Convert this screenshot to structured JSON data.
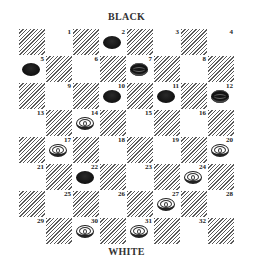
{
  "labels": {
    "top": "BLACK",
    "bottom": "WHITE"
  },
  "board": {
    "size": 8,
    "square_px": 27,
    "origin": [
      18,
      28
    ],
    "dark_square_style": "diagonal-hatch",
    "playable_squares": "light",
    "colors": {
      "hatch": "#5a5a5a",
      "light": "#ffffff",
      "black_piece": "#111111",
      "white_piece": "#ffffff"
    }
  },
  "squares": [
    {
      "n": 1,
      "row": 0,
      "col": 1
    },
    {
      "n": 2,
      "row": 0,
      "col": 3
    },
    {
      "n": 3,
      "row": 0,
      "col": 5
    },
    {
      "n": 4,
      "row": 0,
      "col": 7
    },
    {
      "n": 5,
      "row": 1,
      "col": 0
    },
    {
      "n": 6,
      "row": 1,
      "col": 2
    },
    {
      "n": 7,
      "row": 1,
      "col": 4
    },
    {
      "n": 8,
      "row": 1,
      "col": 6
    },
    {
      "n": 9,
      "row": 2,
      "col": 1
    },
    {
      "n": 10,
      "row": 2,
      "col": 3
    },
    {
      "n": 11,
      "row": 2,
      "col": 5
    },
    {
      "n": 12,
      "row": 2,
      "col": 7
    },
    {
      "n": 13,
      "row": 3,
      "col": 0
    },
    {
      "n": 14,
      "row": 3,
      "col": 2
    },
    {
      "n": 15,
      "row": 3,
      "col": 4
    },
    {
      "n": 16,
      "row": 3,
      "col": 6
    },
    {
      "n": 17,
      "row": 4,
      "col": 1
    },
    {
      "n": 18,
      "row": 4,
      "col": 3
    },
    {
      "n": 19,
      "row": 4,
      "col": 5
    },
    {
      "n": 20,
      "row": 4,
      "col": 7
    },
    {
      "n": 21,
      "row": 5,
      "col": 0
    },
    {
      "n": 22,
      "row": 5,
      "col": 2
    },
    {
      "n": 23,
      "row": 5,
      "col": 4
    },
    {
      "n": 24,
      "row": 5,
      "col": 6
    },
    {
      "n": 25,
      "row": 6,
      "col": 1
    },
    {
      "n": 26,
      "row": 6,
      "col": 3
    },
    {
      "n": 27,
      "row": 6,
      "col": 5
    },
    {
      "n": 28,
      "row": 6,
      "col": 7
    },
    {
      "n": 29,
      "row": 7,
      "col": 0
    },
    {
      "n": 30,
      "row": 7,
      "col": 2
    },
    {
      "n": 31,
      "row": 7,
      "col": 4
    },
    {
      "n": 32,
      "row": 7,
      "col": 6
    }
  ],
  "pieces": [
    {
      "square": 2,
      "color": "black",
      "king": false
    },
    {
      "square": 5,
      "color": "black",
      "king": false
    },
    {
      "square": 7,
      "color": "black",
      "king": true
    },
    {
      "square": 10,
      "color": "black",
      "king": false
    },
    {
      "square": 11,
      "color": "black",
      "king": false
    },
    {
      "square": 12,
      "color": "black",
      "king": true
    },
    {
      "square": 22,
      "color": "black",
      "king": false
    },
    {
      "square": 14,
      "color": "white",
      "king": false
    },
    {
      "square": 17,
      "color": "white",
      "king": false
    },
    {
      "square": 20,
      "color": "white",
      "king": false
    },
    {
      "square": 24,
      "color": "white",
      "king": false
    },
    {
      "square": 27,
      "color": "white",
      "king": false
    },
    {
      "square": 30,
      "color": "white",
      "king": false
    },
    {
      "square": 31,
      "color": "white",
      "king": false
    }
  ]
}
